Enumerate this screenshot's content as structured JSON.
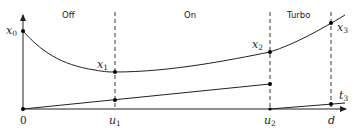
{
  "diagram": {
    "regions": [
      {
        "id": "off",
        "label": "Off"
      },
      {
        "id": "on",
        "label": "On"
      },
      {
        "id": "turbo",
        "label": "Turbo"
      }
    ],
    "x_ticks": [
      {
        "id": "origin",
        "label": "0"
      },
      {
        "id": "u1",
        "base": "u",
        "sub": "1"
      },
      {
        "id": "u2",
        "base": "u",
        "sub": "2"
      },
      {
        "id": "d",
        "base": "d",
        "sub": ""
      }
    ],
    "points": [
      {
        "id": "x0",
        "base": "x",
        "sub": "0"
      },
      {
        "id": "x1",
        "base": "x",
        "sub": "1"
      },
      {
        "id": "x2",
        "base": "x",
        "sub": "2"
      },
      {
        "id": "x3",
        "base": "x",
        "sub": "3"
      },
      {
        "id": "t3",
        "base": "t",
        "sub": "3"
      }
    ],
    "colors": {
      "stroke": "#222222",
      "background": "#ffffff"
    }
  }
}
